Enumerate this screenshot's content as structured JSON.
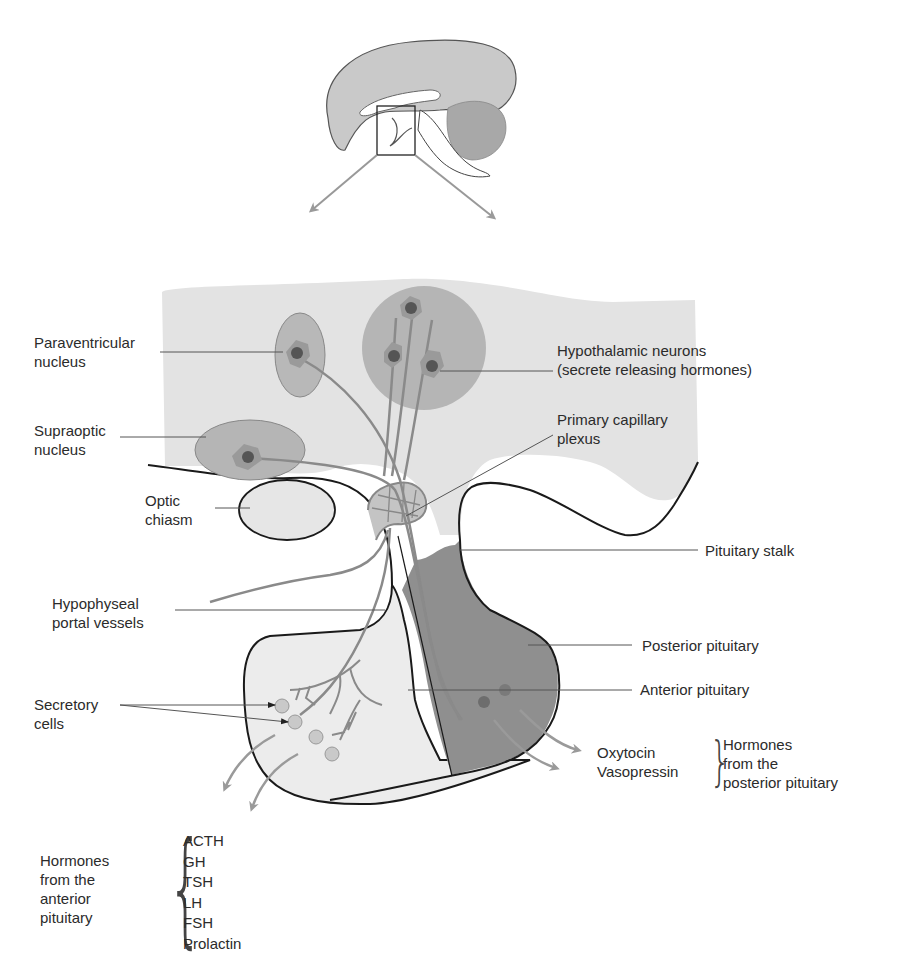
{
  "colors": {
    "hypothalamus_fill": "#e3e3e3",
    "nucleus_fill": "#b8b8b8",
    "neuron_fill": "#9a9a9a",
    "neuron_nucleus": "#555555",
    "anterior_fill": "#ececec",
    "posterior_fill": "#8f8f8f",
    "axon_stroke": "#8a8a8a",
    "outline": "#1a1a1a",
    "arrow": "#9a9a9a"
  },
  "labels": {
    "paraventricular": [
      "Paraventricular",
      "nucleus"
    ],
    "supraoptic": [
      "Supraoptic",
      "nucleus"
    ],
    "optic_chiasm": [
      "Optic",
      "chiasm"
    ],
    "hypothalamic_neurons": [
      "Hypothalamic neurons",
      "(secrete releasing hormones)"
    ],
    "primary_capillary": [
      "Primary capillary",
      "plexus"
    ],
    "pituitary_stalk": "Pituitary stalk",
    "portal_vessels": [
      "Hypophyseal",
      "portal vessels"
    ],
    "posterior_pituitary": "Posterior pituitary",
    "anterior_pituitary": "Anterior pituitary",
    "secretory_cells": [
      "Secretory",
      "cells"
    ]
  },
  "posterior_hormones": {
    "items": [
      "Oxytocin",
      "Vasopressin"
    ],
    "group_label": [
      "Hormones",
      "from the",
      "posterior pituitary"
    ]
  },
  "anterior_hormones": {
    "group_label": [
      "Hormones",
      "from the",
      "anterior",
      "pituitary"
    ],
    "items": [
      "ACTH",
      "GH",
      "TSH",
      "LH",
      "FSH",
      "Prolactin"
    ]
  }
}
